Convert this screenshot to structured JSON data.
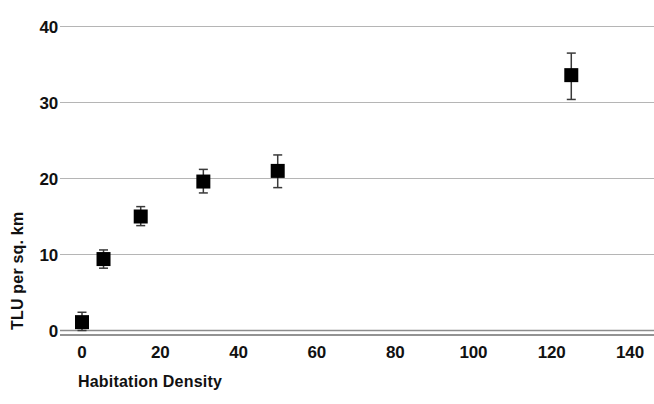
{
  "chart_data": {
    "type": "scatter",
    "title": "",
    "subtitle": "",
    "xlabel": "Habitation Density",
    "ylabel": "TLU per sq. km",
    "xlim": [
      0,
      140
    ],
    "ylim": [
      0,
      40
    ],
    "xticks": [
      0,
      20,
      40,
      60,
      80,
      100,
      120,
      140
    ],
    "yticks": [
      0,
      10,
      20,
      30,
      40
    ],
    "xtick_labels": [
      "0",
      "20",
      "40",
      "60",
      "80",
      "100",
      "120",
      "140"
    ],
    "ytick_labels": [
      "0",
      "10",
      "20",
      "30",
      "40"
    ],
    "grid": "horizontal",
    "legend": "none",
    "marker": "filled-square",
    "marker_color": "#000000",
    "gridline_color": "#b5b5b5",
    "axis_color": "#8c8c8c",
    "error_bars": "vertical",
    "series": [
      {
        "name": "TLU per sq. km",
        "points": [
          {
            "x": 0,
            "y": 1.1,
            "yerr_low": 0.0,
            "yerr_high": 2.4
          },
          {
            "x": 5.5,
            "y": 9.4,
            "yerr_low": 8.2,
            "yerr_high": 10.6
          },
          {
            "x": 15,
            "y": 15.0,
            "yerr_low": 13.8,
            "yerr_high": 16.3
          },
          {
            "x": 31,
            "y": 19.6,
            "yerr_low": 18.1,
            "yerr_high": 21.2
          },
          {
            "x": 50,
            "y": 21.0,
            "yerr_low": 18.8,
            "yerr_high": 23.1
          },
          {
            "x": 125,
            "y": 33.6,
            "yerr_low": 30.4,
            "yerr_high": 36.5
          }
        ]
      }
    ]
  }
}
